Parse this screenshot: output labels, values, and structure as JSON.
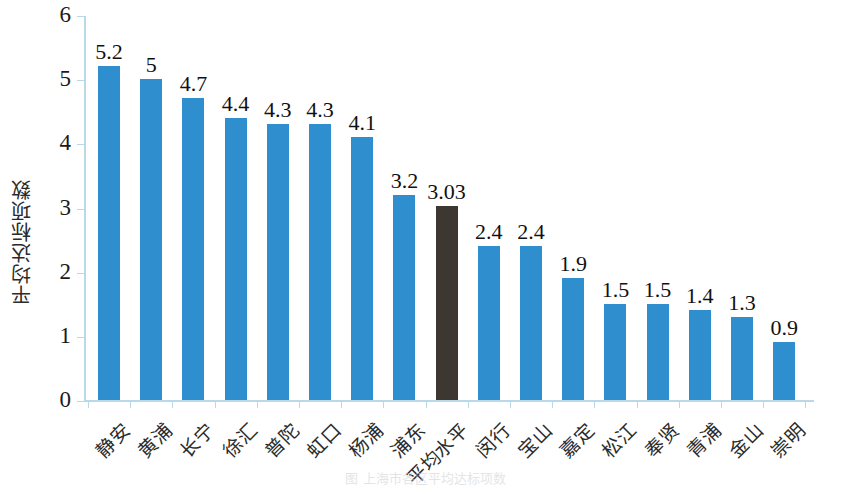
{
  "chart_data": {
    "type": "bar",
    "title": "",
    "subtitle": "",
    "xlabel": "",
    "ylabel": "平均达标项数",
    "ylim": [
      0,
      6
    ],
    "ytick_labels": [
      "6",
      "5",
      "4",
      "3",
      "2",
      "1",
      "0"
    ],
    "ytick_values": [
      6,
      5,
      4,
      3,
      2,
      1,
      0
    ],
    "grid": false,
    "legend": null,
    "legend_position": "none",
    "categories": [
      "静安",
      "黄浦",
      "长宁",
      "徐汇",
      "普陀",
      "虹口",
      "杨浦",
      "浦东",
      "平均水平",
      "闵行",
      "宝山",
      "嘉定",
      "松江",
      "奉贤",
      "青浦",
      "金山",
      "崇明"
    ],
    "values": [
      5.2,
      5,
      4.7,
      4.4,
      4.3,
      4.3,
      4.1,
      3.2,
      3.03,
      2.4,
      2.4,
      1.9,
      1.5,
      1.5,
      1.4,
      1.3,
      0.9
    ],
    "value_labels": [
      "5.2",
      "5",
      "4.7",
      "4.4",
      "4.3",
      "4.3",
      "4.1",
      "3.2",
      "3.03",
      "2.4",
      "2.4",
      "1.9",
      "1.5",
      "1.5",
      "1.4",
      "1.3",
      "0.9"
    ],
    "highlight_index": 8,
    "colors": {
      "bar": "#2f8ece",
      "bar_highlight": "#3d3732",
      "axis": "#b9d9e8",
      "text": "#1a1a1a",
      "background": "#ffffff"
    }
  },
  "caption": {
    "remnant_text": "图 上海市各区平均达标项数"
  }
}
